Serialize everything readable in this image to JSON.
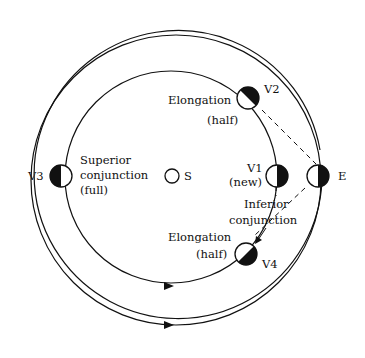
{
  "diagram": {
    "bodies": {
      "sun": {
        "label": "S"
      },
      "earth": {
        "label": "E"
      },
      "v1": {
        "label": "V1",
        "phase": "(new)",
        "position": "Inferior",
        "position2": "conjunction"
      },
      "v2": {
        "label": "V2",
        "position": "Elongation",
        "phase": "(half)"
      },
      "v3": {
        "label": "V3",
        "position": "Superior",
        "position2": "conjunction",
        "phase": "(full)"
      },
      "v4": {
        "label": "V4",
        "position": "Elongation",
        "phase": "(half)"
      }
    },
    "orbits": [
      {
        "name": "venus-orbit",
        "direction": "counterclockwise"
      },
      {
        "name": "earth-orbit",
        "direction": "counterclockwise"
      }
    ],
    "colors": {
      "ink": "#111111",
      "background": "#ffffff"
    }
  }
}
